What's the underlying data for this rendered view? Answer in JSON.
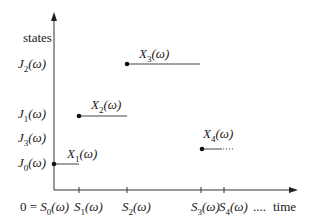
{
  "diagram": {
    "type": "step-process-sample-path",
    "y_axis_label": "states",
    "x_axis_label": "time",
    "state_labels": [
      {
        "id": "J2",
        "text": "J",
        "sub": "2",
        "arg": "(ω)",
        "y": 64
      },
      {
        "id": "J1",
        "text": "J",
        "sub": "1",
        "arg": "(ω)",
        "y": 116
      },
      {
        "id": "J3",
        "text": "J",
        "sub": "3",
        "arg": "(ω)",
        "y": 139
      },
      {
        "id": "J0",
        "text": "J",
        "sub": "0",
        "arg": "(ω)",
        "y": 164
      }
    ],
    "time_labels": [
      {
        "id": "S0",
        "prefix": "0 = ",
        "text": "S",
        "sub": "0",
        "arg": "(ω)",
        "x": 54
      },
      {
        "id": "S1",
        "prefix": "",
        "text": "S",
        "sub": "1",
        "arg": "(ω)",
        "x": 79
      },
      {
        "id": "S2",
        "prefix": "",
        "text": "S",
        "sub": "2",
        "arg": "(ω)",
        "x": 127
      },
      {
        "id": "S3",
        "prefix": "",
        "text": "S",
        "sub": "3",
        "arg": "(ω)",
        "x": 202
      },
      {
        "id": "S4",
        "prefix": "",
        "text": "S",
        "sub": "4",
        "arg": "(ω)",
        "x": 224
      }
    ],
    "time_ellipsis": "....",
    "segments": [
      {
        "id": "X1",
        "label": "X",
        "sub": "1",
        "arg": "(ω)",
        "x_start": 54,
        "x_end": 79,
        "y": 164
      },
      {
        "id": "X2",
        "label": "X",
        "sub": "2",
        "arg": "(ω)",
        "x_start": 79,
        "x_end": 127,
        "y": 116
      },
      {
        "id": "X3",
        "label": "X",
        "sub": "3",
        "arg": "(ω)",
        "x_start": 127,
        "x_end": 200,
        "y": 64
      },
      {
        "id": "X4",
        "label": "X",
        "sub": "4",
        "arg": "(ω)",
        "x_start": 202,
        "x_end": 222,
        "y": 149,
        "continues": true
      }
    ]
  }
}
